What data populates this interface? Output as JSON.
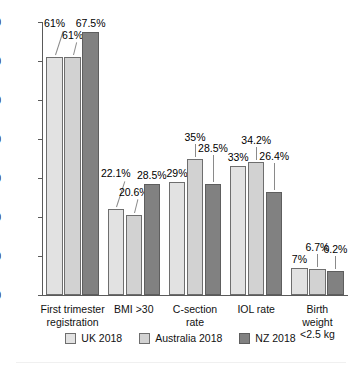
{
  "chart_data": {
    "type": "bar",
    "title": "",
    "xlabel": "",
    "ylabel": "",
    "ylim": [
      0,
      70
    ],
    "ytick_step": 10,
    "yticks": [
      "70",
      "60",
      "50",
      "40",
      "30",
      "20",
      "10",
      "0"
    ],
    "grid": false,
    "legend_position": "bottom",
    "categories": [
      "First trimester\nregistration",
      "BMI >30",
      "C-section\nrate",
      "IOL rate",
      "Birth weight\n<2.5 kg"
    ],
    "series": [
      {
        "name": "UK 2018",
        "color": "#e2e2e2",
        "values": [
          61,
          22.1,
          29,
          33,
          7
        ],
        "labels": [
          "61%",
          "22.1%",
          "29%",
          "33%",
          "7%"
        ]
      },
      {
        "name": "Australia 2018",
        "color": "#d2d2d2",
        "values": [
          61,
          20.6,
          35,
          34.2,
          6.7
        ],
        "labels": [
          "61%",
          "20.6%",
          "35%",
          "34.2%",
          "6.7%"
        ]
      },
      {
        "name": "NZ 2018",
        "color": "#818181",
        "values": [
          67.5,
          28.5,
          28.5,
          26.4,
          6.2
        ],
        "labels": [
          "67.5%",
          "28.5%",
          "28.5%",
          "26.4%",
          "6.2%"
        ]
      }
    ]
  },
  "legend": {
    "items": [
      {
        "label": "UK 2018"
      },
      {
        "label": "Australia 2018"
      },
      {
        "label": "NZ 2018"
      }
    ]
  }
}
